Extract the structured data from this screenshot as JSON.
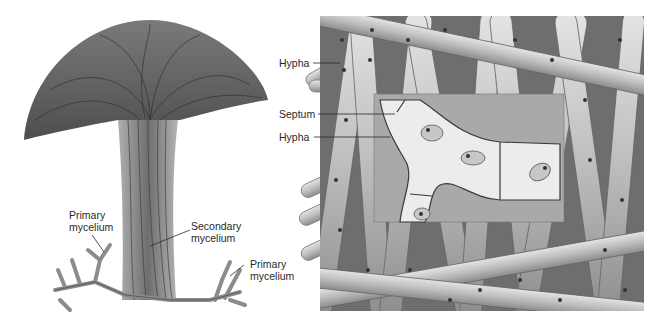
{
  "figure": {
    "left_panel": {
      "name": "mushroom-fruiting-body",
      "labels": [
        {
          "id": "primary-mycelium-left",
          "line1": "Primary",
          "line2": "mycelium"
        },
        {
          "id": "secondary-mycelium",
          "line1": "Secondary",
          "line2": "mycelium"
        },
        {
          "id": "primary-mycelium-right",
          "line1": "Primary",
          "line2": "mycelium"
        }
      ]
    },
    "right_panel": {
      "name": "hyphae-mass-with-inset",
      "labels": [
        {
          "id": "hypha-top",
          "text": "Hypha"
        },
        {
          "id": "septum",
          "text": "Septum"
        },
        {
          "id": "hypha-bottom",
          "text": "Hypha"
        }
      ]
    },
    "colors": {
      "background": "#ffffff",
      "cap_dark": "#5a5a5a",
      "cap_mid": "#8a8a8a",
      "stalk": "#9a9a9a",
      "hypha_fill": "#c8c8c8",
      "hypha_dark": "#4a4a4a",
      "inset_bg": "#bdbdbd",
      "cell_fill": "#e8e8e8",
      "label_text": "#2a2a2a"
    }
  }
}
